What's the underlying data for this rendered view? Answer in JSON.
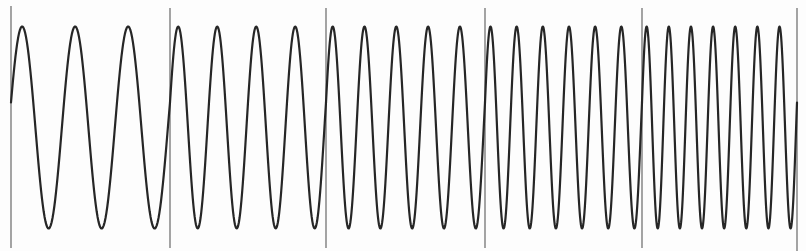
{
  "chart_data": {
    "type": "line",
    "title": "",
    "xlabel": "",
    "ylabel": "",
    "grid": false,
    "legend": "none",
    "segments": [
      {
        "index": 1,
        "cycles": 3
      },
      {
        "index": 2,
        "cycles": 4
      },
      {
        "index": 3,
        "cycles": 5
      },
      {
        "index": 4,
        "cycles": 6
      },
      {
        "index": 5,
        "cycles": 7
      }
    ],
    "amplitude": 1.0,
    "ylim": [
      -1.25,
      1.25
    ],
    "segment_markers": 6,
    "colors": {
      "wave": "#262626",
      "markers": "#5a5a5a",
      "background": "#fdfdfd"
    }
  }
}
